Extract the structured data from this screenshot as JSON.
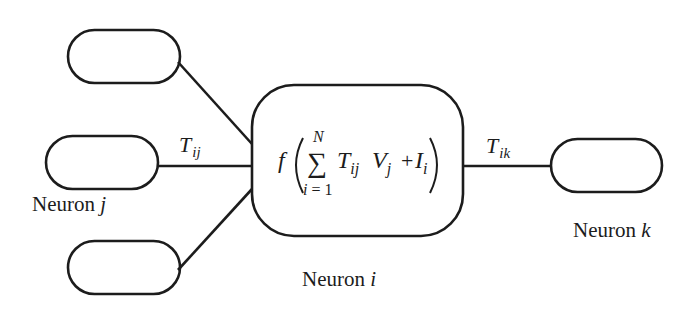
{
  "diagram": {
    "type": "neuron-network-schematic",
    "colors": {
      "stroke": "#1c1c1c",
      "background": "#ffffff"
    },
    "nodes": [
      {
        "id": "input-top",
        "label": ""
      },
      {
        "id": "neuron-j",
        "label_prefix": "Neuron",
        "label_var": "j"
      },
      {
        "id": "input-bottom",
        "label": ""
      },
      {
        "id": "neuron-i",
        "label_prefix": "Neuron",
        "label_var": "i"
      },
      {
        "id": "neuron-k",
        "label_prefix": "Neuron",
        "label_var": "k"
      }
    ],
    "edges": [
      {
        "from": "input-top",
        "to": "neuron-i",
        "weight": ""
      },
      {
        "from": "neuron-j",
        "to": "neuron-i",
        "weight_symbol": "T",
        "weight_sub": "ij"
      },
      {
        "from": "input-bottom",
        "to": "neuron-i",
        "weight": ""
      },
      {
        "from": "neuron-i",
        "to": "neuron-k",
        "weight_symbol": "T",
        "weight_sub": "ik"
      }
    ],
    "formula": {
      "func": "f",
      "sum_symbol": "∑",
      "sum_upper": "N",
      "sum_lower_var": "i",
      "sum_lower_rest": " = 1",
      "term1_symbol": "T",
      "term1_sub": "ij",
      "term2_symbol": "V",
      "term2_sub": "j",
      "plus": "+",
      "term3_symbol": "I",
      "term3_sub": "i"
    }
  }
}
